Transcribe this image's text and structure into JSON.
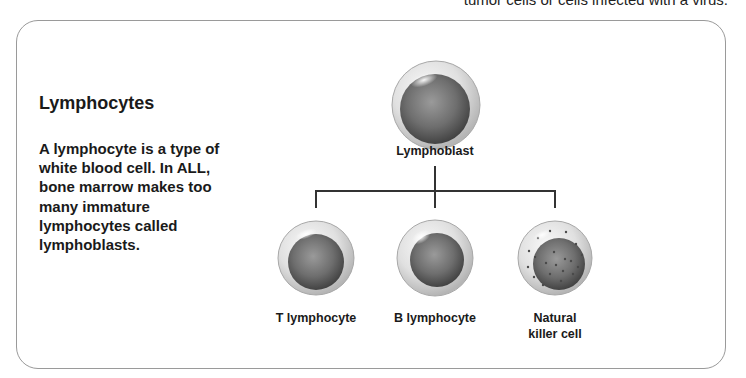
{
  "top_clip_text": "tumor cells or cells infected with a virus.",
  "sidebar": {
    "heading": "Lymphocytes",
    "body": "A lymphocyte is a type of white blood cell. In ALL, bone marrow makes too many immature lymphocytes called lymphoblasts."
  },
  "diagram": {
    "root": {
      "label": "Lymphoblast",
      "icon": "lymphoblast-cell"
    },
    "children": [
      {
        "label": "T lymphocyte",
        "icon": "t-lymphocyte-cell"
      },
      {
        "label": "B lymphocyte",
        "icon": "b-lymphocyte-cell"
      },
      {
        "label_line1": "Natural",
        "label_line2": "killer cell",
        "icon": "natural-killer-cell"
      }
    ]
  },
  "colors": {
    "border": "#9a9a9a",
    "text": "#1a1a1a",
    "line": "#333333",
    "cell_membrane": "#d9d9d9",
    "nucleus": "#6b6b6b"
  }
}
